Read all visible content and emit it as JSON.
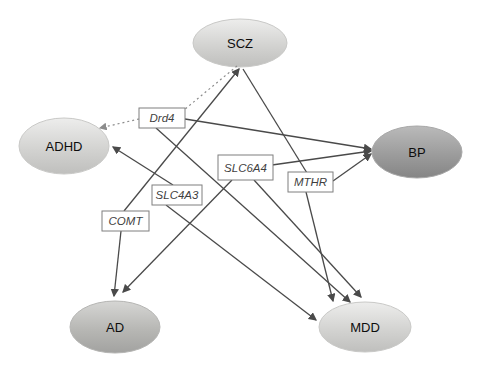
{
  "diagram": {
    "colors": {
      "background": "#ffffff",
      "solid_edge": "#4a4a4a",
      "dotted_edge": "#8c8c8c",
      "gene_box_border": "#7f7f7f",
      "ellipse_light": "#d6d6d4",
      "ellipse_medium": "#b8b8b6",
      "ellipse_dark": "#9a9a9a"
    },
    "disorder_nodes": [
      {
        "id": "scz",
        "label": "SCZ",
        "shade": "light"
      },
      {
        "id": "adhd",
        "label": "ADHD",
        "shade": "light"
      },
      {
        "id": "bp",
        "label": "BP",
        "shade": "dark"
      },
      {
        "id": "ad",
        "label": "AD",
        "shade": "medium"
      },
      {
        "id": "mdd",
        "label": "MDD",
        "shade": "light"
      }
    ],
    "gene_nodes": [
      {
        "id": "drd4",
        "label": "Drd4"
      },
      {
        "id": "slc6a4",
        "label": "SLC6A4"
      },
      {
        "id": "slc4a3",
        "label": "SLC4A3"
      },
      {
        "id": "mthr",
        "label": "MTHR"
      },
      {
        "id": "comt",
        "label": "COMT"
      }
    ],
    "edges": [
      {
        "from": "scz",
        "to": "drd4",
        "style": "dotted",
        "arrow": false,
        "x1": 237,
        "y1": 66,
        "x2": 184,
        "y2": 110
      },
      {
        "from": "drd4",
        "to": "adhd",
        "style": "dotted",
        "arrow": true,
        "x1": 139,
        "y1": 119,
        "x2": 100,
        "y2": 128
      },
      {
        "from": "drd4",
        "to": "bp",
        "style": "solid",
        "arrow": true,
        "x1": 185,
        "y1": 119,
        "x2": 371,
        "y2": 149
      },
      {
        "from": "drd4",
        "to": "mdd",
        "style": "solid",
        "arrow": true,
        "x1": 156,
        "y1": 128,
        "x2": 350,
        "y2": 302
      },
      {
        "from": "slc6a4",
        "to": "bp",
        "style": "solid",
        "arrow": true,
        "x1": 272,
        "y1": 165,
        "x2": 371,
        "y2": 151
      },
      {
        "from": "slc6a4",
        "to": "ad",
        "style": "solid",
        "arrow": true,
        "x1": 232,
        "y1": 180,
        "x2": 123,
        "y2": 292
      },
      {
        "from": "slc6a4",
        "to": "mdd",
        "style": "solid",
        "arrow": true,
        "x1": 254,
        "y1": 180,
        "x2": 361,
        "y2": 297
      },
      {
        "from": "slc4a3",
        "to": "adhd",
        "style": "solid",
        "arrow": true,
        "x1": 173,
        "y1": 185,
        "x2": 113,
        "y2": 147
      },
      {
        "from": "slc4a3",
        "to": "mdd",
        "style": "solid",
        "arrow": true,
        "x1": 166,
        "y1": 205,
        "x2": 316,
        "y2": 320
      },
      {
        "from": "mthr",
        "to": "bp",
        "style": "solid",
        "arrow": true,
        "x1": 333,
        "y1": 181,
        "x2": 371,
        "y2": 154
      },
      {
        "from": "mthr",
        "to": "mdd",
        "style": "solid",
        "arrow": true,
        "x1": 306,
        "y1": 192,
        "x2": 333,
        "y2": 301
      },
      {
        "from": "mthr",
        "to": "scz",
        "style": "solid",
        "arrow": false,
        "x1": 307,
        "y1": 173,
        "x2": 243,
        "y2": 69
      },
      {
        "from": "comt",
        "to": "scz",
        "style": "solid",
        "arrow": true,
        "x1": 124,
        "y1": 211,
        "x2": 239,
        "y2": 69
      },
      {
        "from": "comt",
        "to": "ad",
        "style": "solid",
        "arrow": true,
        "x1": 121,
        "y1": 231,
        "x2": 114,
        "y2": 296
      }
    ]
  }
}
